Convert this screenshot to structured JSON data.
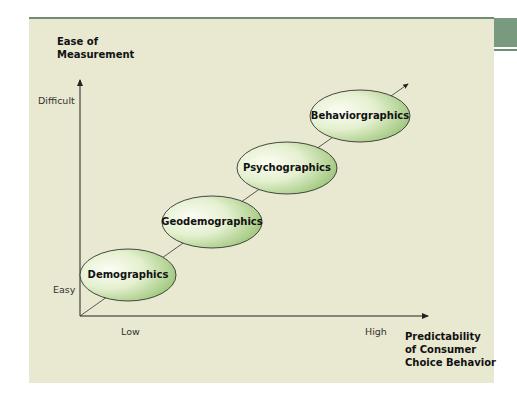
{
  "diagram": {
    "y_axis": {
      "title_line1": "Ease of",
      "title_line2": "Measurement",
      "tick_high": "Difficult",
      "tick_low": "Easy"
    },
    "x_axis": {
      "title_line1": "Predictability",
      "title_line2": "of Consumer",
      "title_line3": "Choice Behavior",
      "tick_low": "Low",
      "tick_high": "High"
    },
    "nodes": [
      {
        "label": "Demographics"
      },
      {
        "label": "Geodemographics"
      },
      {
        "label": "Psychographics"
      },
      {
        "label": "Behaviorgraphics"
      }
    ],
    "colors": {
      "panel_bg": "#e9e8d0",
      "accent_green": "#7a9a80",
      "ellipse_fill_light": "#fbfdf3",
      "ellipse_fill_dark": "#9dc679",
      "axis": "#222222"
    }
  }
}
